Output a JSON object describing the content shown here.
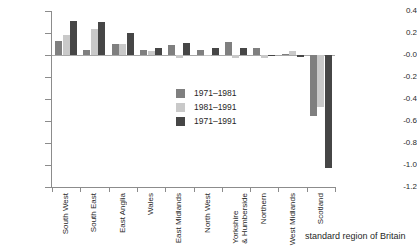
{
  "chart_data": {
    "type": "bar",
    "title": "",
    "xlabel": "standard region of Britain",
    "ylabel": "",
    "ylim": [
      -1.2,
      0.4
    ],
    "yticks": [
      "0.4",
      "0.2",
      "-0.0",
      "-0.2",
      "-0.4",
      "-0.6",
      "-0.8",
      "-1.0",
      "-1.2"
    ],
    "ytick_values": [
      0.4,
      0.2,
      0.0,
      -0.2,
      -0.4,
      -0.6,
      -0.8,
      -1.0,
      -1.2
    ],
    "grid": false,
    "legend_position": "center",
    "categories": [
      "South West",
      "South East",
      "East Anglia",
      "Wales",
      "East Midlands",
      "North West",
      "Yorkshire\n& Humberside",
      "Northern",
      "West Midlands",
      "Scotland"
    ],
    "series": [
      {
        "name": "1971–1981",
        "color": "#7f7f7f",
        "values": [
          0.13,
          0.05,
          0.1,
          0.05,
          0.09,
          0.05,
          0.12,
          0.06,
          0.01,
          -0.55
        ]
      },
      {
        "name": "1981–1991",
        "color": "#c9c9c9",
        "values": [
          0.18,
          0.24,
          0.1,
          0.04,
          -0.03,
          0.0,
          -0.03,
          -0.03,
          0.04,
          -0.47
        ]
      },
      {
        "name": "1971–1991",
        "color": "#464646",
        "values": [
          0.31,
          0.3,
          0.2,
          0.06,
          0.11,
          0.06,
          0.06,
          0.0,
          -0.02,
          -1.03
        ]
      }
    ]
  },
  "legend": {
    "items": [
      {
        "label": "1971–1981",
        "color": "#7f7f7f"
      },
      {
        "label": "1981–1991",
        "color": "#c9c9c9"
      },
      {
        "label": "1971–1991",
        "color": "#464646"
      }
    ]
  }
}
